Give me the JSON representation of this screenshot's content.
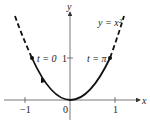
{
  "diagram": {
    "curve_label": "y = x²",
    "point_left_label": "t = 0",
    "point_right_label": "t = π",
    "axis_x_label": "x",
    "axis_y_label": "y",
    "ticks": {
      "x_neg1": "−1",
      "x_zero": "0",
      "x_pos1": "1",
      "y_one": "1"
    }
  }
}
